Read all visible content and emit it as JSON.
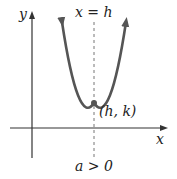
{
  "diagram": {
    "axis_x_label": "x",
    "axis_y_label": "y",
    "axis_of_symmetry_label": "x = h",
    "vertex_label": "(h, k)",
    "condition_label": "a > 0",
    "colors": {
      "parabola": "#555555",
      "axes": "#333333",
      "dashed_line": "#777777",
      "vertex": "#555555"
    }
  }
}
